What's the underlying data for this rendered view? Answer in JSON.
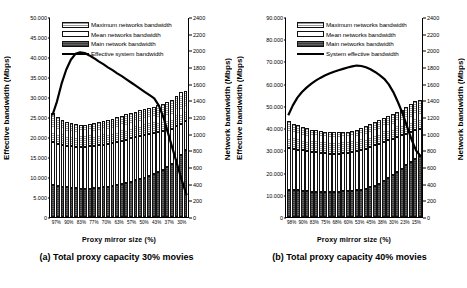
{
  "figure": {
    "panels": [
      {
        "id": "a",
        "caption": "(a) Total proxy capacity 30% movies",
        "xaxis_title": "Proxy mirror size (%)",
        "ylabel_left": "Effective bandwidth (Mbps)",
        "ylabel_right": "Network bandwidth (Mbps)",
        "legend": [
          "Maximum networks bandwidth",
          "Mean networks bandwidth",
          "Main network bandwidth",
          "Effective system bandwidth"
        ],
        "chart_data": {
          "type": "bar",
          "title": "(a) Total proxy capacity 30% movies",
          "xlabel": "Proxy mirror size (%)",
          "ylabel": "Effective bandwidth (Mbps)",
          "ylabel2": "Network bandwidth (Mbps)",
          "ylim": [
            0,
            50000
          ],
          "ylim2": [
            0,
            2400
          ],
          "ytick_labels": [
            "0",
            "5.000",
            "10.000",
            "15.000",
            "20.000",
            "25.000",
            "30.000",
            "35.000",
            "40.000",
            "45.000",
            "50.000"
          ],
          "ytick_labels_right": [
            "0",
            "200",
            "400",
            "600",
            "800",
            "1000",
            "1200",
            "1400",
            "1600",
            "1800",
            "2000",
            "2200",
            "2400"
          ],
          "grid": false,
          "legend_position": "top-center",
          "categories": [
            "97%",
            "",
            "",
            "90%",
            "",
            "",
            "83%",
            "",
            "",
            "77%",
            "",
            "",
            "70%",
            "",
            "",
            "63%",
            "",
            "",
            "57%",
            "",
            "",
            "50%",
            "",
            "",
            "43%",
            "",
            "",
            "37%",
            "",
            "30%"
          ],
          "xtick_labels": [
            "97%",
            "90%",
            "83%",
            "77%",
            "70%",
            "63%",
            "57%",
            "50%",
            "43%",
            "37%",
            "30%"
          ],
          "series": [
            {
              "name": "Main network bandwidth",
              "stack": "bars",
              "values": [
                380,
                370,
                360,
                355,
                350,
                345,
                340,
                340,
                340,
                345,
                350,
                355,
                365,
                375,
                385,
                395,
                410,
                425,
                440,
                455,
                470,
                490,
                515,
                540,
                570,
                600,
                640,
                690,
                750,
                800
              ]
            },
            {
              "name": "Mean networks bandwidth",
              "stack": "bars",
              "values": [
                900,
                880,
                865,
                855,
                850,
                845,
                845,
                845,
                850,
                855,
                860,
                870,
                880,
                890,
                900,
                915,
                930,
                945,
                960,
                975,
                990,
                1000,
                1010,
                1020,
                1030,
                1040,
                1060,
                1090,
                1120,
                1150
              ]
            },
            {
              "name": "Maximum networks bandwidth",
              "stack": "bars",
              "values": [
                1250,
                1200,
                1165,
                1140,
                1125,
                1115,
                1110,
                1110,
                1115,
                1125,
                1135,
                1150,
                1165,
                1180,
                1200,
                1215,
                1235,
                1250,
                1265,
                1280,
                1295,
                1310,
                1325,
                1340,
                1355,
                1375,
                1410,
                1450,
                1500,
                1515
              ]
            },
            {
              "name": "Effective system bandwidth",
              "type": "line",
              "axis": "left",
              "values": [
                25500,
                29000,
                33500,
                37000,
                39500,
                41000,
                41400,
                41200,
                40600,
                39900,
                39100,
                38400,
                37600,
                36900,
                36100,
                35400,
                34600,
                33800,
                33000,
                32200,
                31400,
                30600,
                29800,
                28000,
                25000,
                21000,
                17000,
                13000,
                9000,
                5500
              ]
            }
          ]
        }
      },
      {
        "id": "b",
        "caption": "(b) Total proxy capacity 40% movies",
        "xaxis_title": "Proxy mirror size (%)",
        "ylabel_left": "Effective bandwidth (Mbps)",
        "ylabel_right": "Network bandwidth (Mbps)",
        "legend": [
          "Maximum networks bandwidth",
          "Mean networks bandwidth",
          "Main networks bandwidth",
          "System effective bandwidth"
        ],
        "chart_data": {
          "type": "bar",
          "title": "(b) Total proxy capacity 40% movies",
          "xlabel": "Proxy mirror size (%)",
          "ylabel": "Effective bandwidth (Mbps)",
          "ylabel2": "Network bandwidth (Mbps)",
          "ylim": [
            0,
            90000
          ],
          "ylim2": [
            0,
            2400
          ],
          "ytick_labels": [
            "0",
            "10.000",
            "20.000",
            "30.000",
            "40.000",
            "50.000",
            "60.000",
            "70.000",
            "80.000",
            "90.000"
          ],
          "ytick_labels_right": [
            "0",
            "200",
            "400",
            "600",
            "800",
            "1000",
            "1200",
            "1400",
            "1600",
            "1800",
            "2000",
            "2200",
            "2400"
          ],
          "grid": false,
          "legend_position": "top-center",
          "categories": [
            "98%",
            "",
            "",
            "90%",
            "",
            "",
            "83%",
            "",
            "",
            "75%",
            "",
            "",
            "68%",
            "",
            "",
            "60%",
            "",
            "",
            "53%",
            "",
            "",
            "45%",
            "",
            "",
            "38%",
            "",
            "",
            "30%",
            "",
            "23%",
            "15%"
          ],
          "xtick_labels": [
            "98%",
            "90%",
            "83%",
            "75%",
            "68%",
            "60%",
            "53%",
            "45%",
            "38%",
            "30%",
            "23%",
            "15%"
          ],
          "series": [
            {
              "name": "Main networks bandwidth",
              "stack": "bars",
              "values": [
                330,
                325,
                320,
                315,
                310,
                305,
                300,
                300,
                300,
                300,
                305,
                305,
                310,
                310,
                315,
                320,
                330,
                340,
                355,
                375,
                400,
                430,
                465,
                500,
                540,
                580,
                620,
                660,
                700,
                735
              ]
            },
            {
              "name": "Mean networks bandwidth",
              "stack": "bars",
              "values": [
                830,
                820,
                810,
                800,
                790,
                780,
                775,
                770,
                765,
                760,
                760,
                760,
                765,
                770,
                780,
                790,
                805,
                820,
                840,
                860,
                880,
                900,
                920,
                940,
                960,
                980,
                1000,
                1020,
                1040,
                1060
              ]
            },
            {
              "name": "Maximum networks bandwidth",
              "stack": "bars",
              "values": [
                1150,
                1120,
                1100,
                1080,
                1065,
                1050,
                1040,
                1030,
                1025,
                1020,
                1015,
                1015,
                1020,
                1025,
                1035,
                1050,
                1070,
                1090,
                1115,
                1140,
                1165,
                1190,
                1215,
                1240,
                1265,
                1290,
                1320,
                1360,
                1390,
                1400
              ]
            },
            {
              "name": "System effective bandwidth",
              "type": "line",
              "axis": "left",
              "values": [
                46000,
                50500,
                54000,
                56500,
                58500,
                60200,
                61700,
                62900,
                64000,
                64900,
                65700,
                66400,
                67000,
                67600,
                68100,
                68500,
                68300,
                67700,
                66800,
                65600,
                64200,
                62500,
                60000,
                56500,
                52000,
                47000,
                41000,
                35000,
                30000,
                27500
              ]
            }
          ]
        }
      }
    ]
  }
}
